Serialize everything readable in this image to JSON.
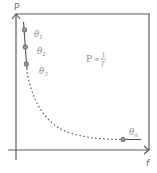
{
  "diagram": {
    "title": "",
    "y_axis_label": "P",
    "x_axis_label": "f",
    "relation": {
      "lhs": "P",
      "op": "∝",
      "num": "1",
      "den": "f"
    },
    "points": [
      {
        "label": "θ",
        "sub": "1"
      },
      {
        "label": "θ",
        "sub": "2"
      },
      {
        "label": "θ",
        "sub": "3"
      },
      {
        "label": "θ",
        "sub": "n"
      }
    ],
    "colors": {
      "axis": "#555555",
      "curve": "#555555",
      "text": "#8a8a8a"
    }
  }
}
